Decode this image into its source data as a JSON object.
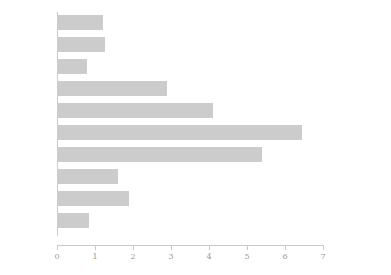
{
  "chart_data": {
    "type": "bar",
    "orientation": "horizontal",
    "title": "",
    "xlabel": "",
    "ylabel": "",
    "xlim": [
      0,
      7
    ],
    "grid": false,
    "legend": null,
    "bar_color": "#cccccc",
    "axis_color": "#c9c9c9",
    "text_color": "#8f8f8f",
    "xticks": [
      0,
      1,
      2,
      3,
      4,
      5,
      6,
      7
    ],
    "xtick_labels": [
      "0",
      "1",
      "2",
      "3",
      "4",
      "5",
      "6",
      "7"
    ],
    "categories": [
      "UK",
      "Germany",
      "USA",
      "Netherlands",
      "Belgium",
      "France",
      "Italy",
      "Spain",
      "Sweden",
      "Ireland"
    ],
    "values": [
      1.2,
      1.25,
      0.8,
      2.9,
      4.1,
      6.45,
      5.4,
      1.6,
      1.9,
      0.85
    ]
  }
}
